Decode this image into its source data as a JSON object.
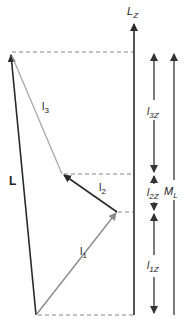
{
  "diagram": {
    "colors": {
      "dark": "#2a2a2a",
      "gray": "#8a8a8a",
      "light_gray": "#a8a8a8",
      "dash": "#888888"
    },
    "vectors": [
      {
        "id": "L",
        "label": "L",
        "from": [
          36,
          315
        ],
        "to": [
          10,
          52
        ],
        "color": "dark"
      },
      {
        "id": "l1",
        "label": "l",
        "subscript": "1",
        "from": [
          36,
          315
        ],
        "to": [
          117,
          212
        ],
        "color": "gray"
      },
      {
        "id": "l2",
        "label": "l",
        "subscript": "2",
        "from": [
          117,
          212
        ],
        "to": [
          62,
          174
        ],
        "color": "dark"
      },
      {
        "id": "l3",
        "label": "l",
        "subscript": "3",
        "from": [
          62,
          174
        ],
        "to": [
          10,
          52
        ],
        "color": "light_gray"
      }
    ],
    "axis": {
      "label": "L",
      "subscript": "Z"
    },
    "components": [
      {
        "label": "l",
        "subscript": "3Z"
      },
      {
        "label": "l",
        "subscript": "2Z"
      },
      {
        "label": "l",
        "subscript": "1Z"
      }
    ],
    "total": {
      "label": "M",
      "subscript": "L"
    }
  }
}
